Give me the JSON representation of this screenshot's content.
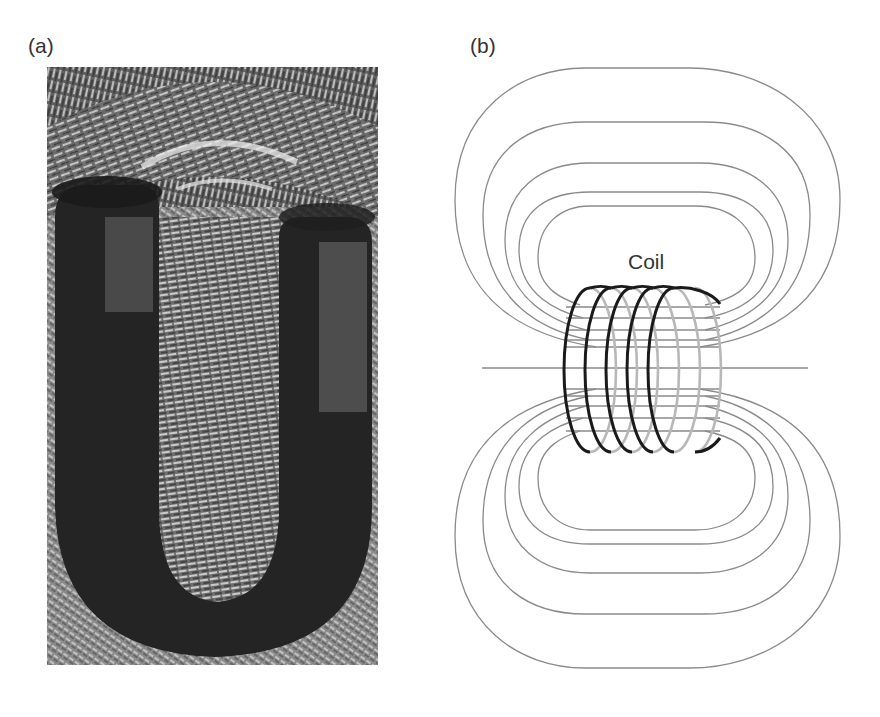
{
  "figure": {
    "panels": [
      {
        "id": "a",
        "label": "(a)",
        "content": "photo of iron filings around a horseshoe (U-shaped) magnet"
      },
      {
        "id": "b",
        "label": "(b)",
        "content": "magnetic field lines around a current-carrying coil (solenoid)",
        "annotations": {
          "coil": "Coil"
        },
        "field_loops_per_side": 5,
        "coil_turns": 5
      }
    ],
    "colors": {
      "background": "#ffffff",
      "field_line": "#8a8a8a",
      "coil_front": "#1a1a1a",
      "coil_back": "#b8b8b8",
      "label_text": "#333333"
    }
  }
}
